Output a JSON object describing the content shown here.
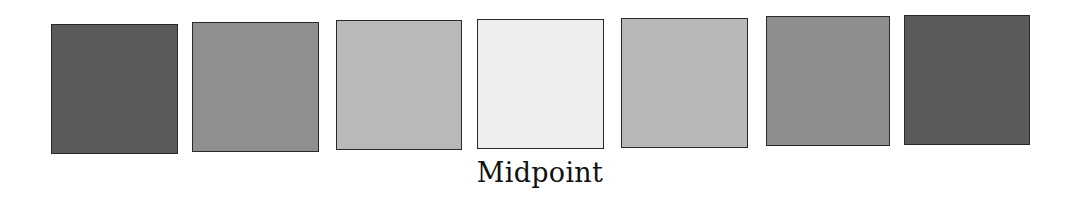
{
  "label": "Midpoint",
  "swatches": [
    {
      "id": 1,
      "color": "#5b5b5b",
      "left": 51,
      "top": 24,
      "width": 127,
      "height": 130
    },
    {
      "id": 2,
      "color": "#8f8f8f",
      "left": 192,
      "top": 22,
      "width": 127,
      "height": 130
    },
    {
      "id": 3,
      "color": "#b9b9b9",
      "left": 336,
      "top": 20,
      "width": 126,
      "height": 130
    },
    {
      "id": 4,
      "color": "#ededed",
      "left": 477,
      "top": 19,
      "width": 127,
      "height": 130
    },
    {
      "id": 5,
      "color": "#b8b8b8",
      "left": 621,
      "top": 18,
      "width": 127,
      "height": 130
    },
    {
      "id": 6,
      "color": "#8e8e8e",
      "left": 766,
      "top": 16,
      "width": 124,
      "height": 130
    },
    {
      "id": 7,
      "color": "#5a5a5a",
      "left": 904,
      "top": 15,
      "width": 126,
      "height": 130
    }
  ]
}
